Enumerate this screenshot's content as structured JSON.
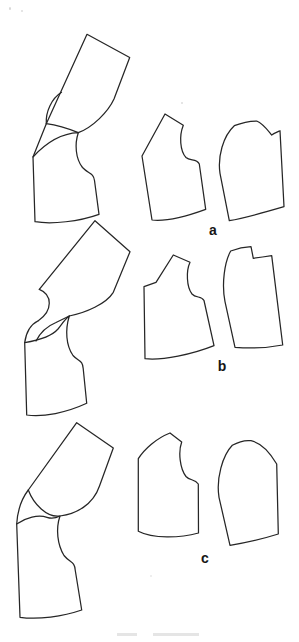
{
  "diagram": {
    "background": "#ffffff",
    "stroke_color": "#262626",
    "kind": "bodice-pattern-dart-pivot-figure",
    "rows": [
      {
        "id": "a",
        "label": "a",
        "composite": "pivoted-bodice-pieces-overlay",
        "pieces": [
          "bodice-front-panel",
          "bodice-back-panel"
        ]
      },
      {
        "id": "b",
        "label": "b",
        "composite": "pivoted-bodice-pieces-overlay",
        "pieces": [
          "bodice-front-panel",
          "bodice-back-panel"
        ]
      },
      {
        "id": "c",
        "label": "c",
        "composite": "pivoted-bodice-pieces-overlay",
        "pieces": [
          "bodice-front-panel",
          "bodice-back-panel"
        ]
      }
    ]
  }
}
